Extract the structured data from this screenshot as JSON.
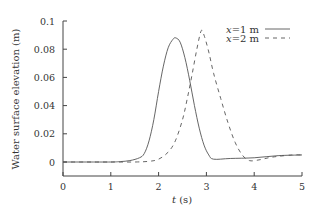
{
  "chart_data": {
    "type": "line",
    "title": "",
    "xlabel": "t (s)",
    "ylabel": "Water surface elevation (m)",
    "xlim": [
      0,
      5
    ],
    "ylim": [
      -0.01,
      0.1
    ],
    "xticks": [
      "0",
      "1",
      "2",
      "3",
      "4",
      "5"
    ],
    "yticks": [
      "0",
      "0.02",
      "0.04",
      "0.06",
      "0.08",
      "0.1"
    ],
    "grid": false,
    "legend_position": "upper right",
    "series": [
      {
        "name": "x=1 m",
        "style": "solid",
        "x": [
          0,
          0.5,
          1.0,
          1.2,
          1.4,
          1.6,
          1.7,
          1.8,
          1.9,
          2.0,
          2.1,
          2.2,
          2.3,
          2.36,
          2.45,
          2.55,
          2.65,
          2.75,
          2.85,
          2.95,
          3.05,
          3.15,
          3.5,
          4.0,
          4.5,
          5.0
        ],
        "y": [
          0,
          0,
          0,
          0.0003,
          0.001,
          0.003,
          0.006,
          0.015,
          0.03,
          0.05,
          0.068,
          0.081,
          0.087,
          0.088,
          0.085,
          0.074,
          0.058,
          0.04,
          0.024,
          0.012,
          0.005,
          0.002,
          0.0025,
          0.003,
          0.0045,
          0.005
        ]
      },
      {
        "name": "x=2 m",
        "style": "dashed",
        "x": [
          0,
          0.5,
          1.0,
          1.5,
          1.8,
          2.0,
          2.2,
          2.35,
          2.5,
          2.6,
          2.7,
          2.8,
          2.89,
          2.95,
          3.05,
          3.15,
          3.3,
          3.45,
          3.6,
          3.75,
          3.9,
          4.1,
          4.3,
          4.5,
          4.8,
          5.0
        ],
        "y": [
          0,
          0,
          0,
          0,
          0.0005,
          0.002,
          0.007,
          0.015,
          0.03,
          0.045,
          0.062,
          0.08,
          0.093,
          0.09,
          0.078,
          0.063,
          0.045,
          0.028,
          0.014,
          0.005,
          0.001,
          0.0015,
          0.003,
          0.004,
          0.005,
          0.005
        ]
      }
    ]
  },
  "legend": {
    "items": [
      {
        "label_var": "x",
        "label_rest": "=1 m",
        "style": "solid"
      },
      {
        "label_var": "x",
        "label_rest": "=2 m",
        "style": "dashed"
      }
    ]
  },
  "axes": {
    "xlabel_var": "t",
    "xlabel_unit": " (s)",
    "ylabel": "Water surface elevation (m)"
  },
  "colors": {
    "line": "#555555",
    "axis": "#444444",
    "text": "#333333"
  }
}
